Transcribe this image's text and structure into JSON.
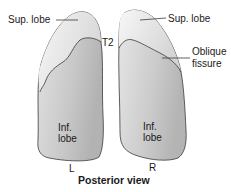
{
  "diagram": {
    "title": "Posterior view",
    "left_lung": {
      "side_label": "L",
      "sup_lobe_label": "Sup. lobe",
      "t2_label": "T2",
      "inf_lobe_label_line1": "Inf.",
      "inf_lobe_label_line2": "lobe"
    },
    "right_lung": {
      "side_label": "R",
      "sup_lobe_label": "Sup. lobe",
      "oblique_fissure_line1": "Oblique",
      "oblique_fissure_line2": "fissure",
      "inf_lobe_label_line1": "Inf.",
      "inf_lobe_label_line2": "lobe"
    },
    "colors": {
      "outline": "#3a3a3a",
      "lobe_fill_light": "#ececec",
      "lobe_fill_dark": "#b9b9b9",
      "text": "#1a1a1a"
    }
  }
}
